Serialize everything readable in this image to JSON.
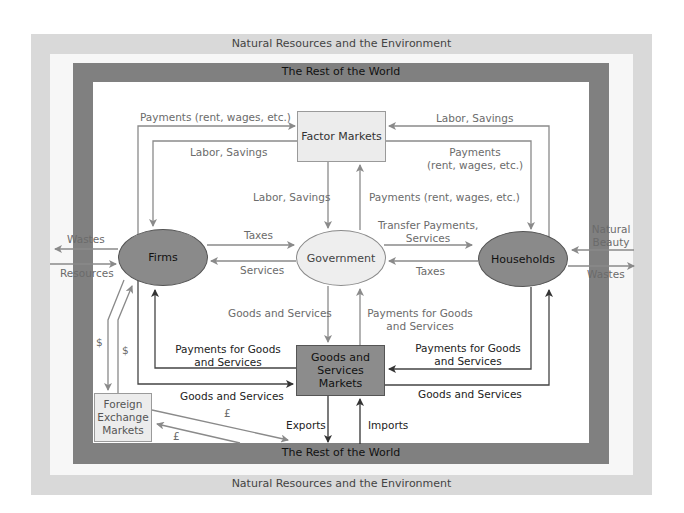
{
  "colors": {
    "outer_frame": "#d9d9d9",
    "dark_frame": "#808080",
    "firms_fill": "#8a8a8a",
    "households_fill": "#8a8a8a",
    "government_fill": "#eeeeee",
    "factor_fill": "#ececec",
    "goods_fill": "#8c8c8c",
    "fx_fill": "#ececec",
    "arrow_gray": "#8a8a8a",
    "arrow_dark": "#444444"
  },
  "frames": {
    "outer_top": "Natural Resources and the Environment",
    "outer_bottom": "Natural Resources and the Environment",
    "dark_top": "The Rest of the World",
    "dark_bottom": "The Rest of the World"
  },
  "nodes": {
    "factor_markets": "Factor Markets",
    "goods_markets": [
      "Goods and",
      "Services",
      "Markets"
    ],
    "foreign_exchange": [
      "Foreign",
      "Exchange",
      "Markets"
    ],
    "firms": "Firms",
    "government": "Government",
    "households": "Households"
  },
  "labels": {
    "payments_to_factor": "Payments (rent, wages, etc.)",
    "labor_to_firms": "Labor, Savings",
    "labor_from_households": "Labor, Savings",
    "payments_to_households_1": "Payments",
    "payments_to_households_2": "(rent, wages, etc.)",
    "labor_to_government": "Labor, Savings",
    "payments_from_government": "Payments (rent, wages, etc.)",
    "taxes_firms": "Taxes",
    "services_firms": "Services",
    "transfer_1": "Transfer Payments,",
    "transfer_2": "Services",
    "taxes_households": "Taxes",
    "wastes_left": "Wastes",
    "resources_left": "Resources",
    "natural_beauty_1": "Natural",
    "natural_beauty_2": "Beauty",
    "wastes_right": "Wastes",
    "gov_goods": "Goods and Services",
    "gov_payments_1": "Payments for Goods",
    "gov_payments_2": "and Services",
    "firms_payments_1": "Payments for Goods",
    "firms_payments_2": "and Services",
    "hh_payments_1": "Payments for Goods",
    "hh_payments_2": "and Services",
    "firms_goods": "Goods and Services",
    "hh_goods": "Goods and Services",
    "dollar_1": "$",
    "dollar_2": "$",
    "pound_1": "£",
    "pound_2": "£",
    "exports": "Exports",
    "imports": "Imports"
  }
}
